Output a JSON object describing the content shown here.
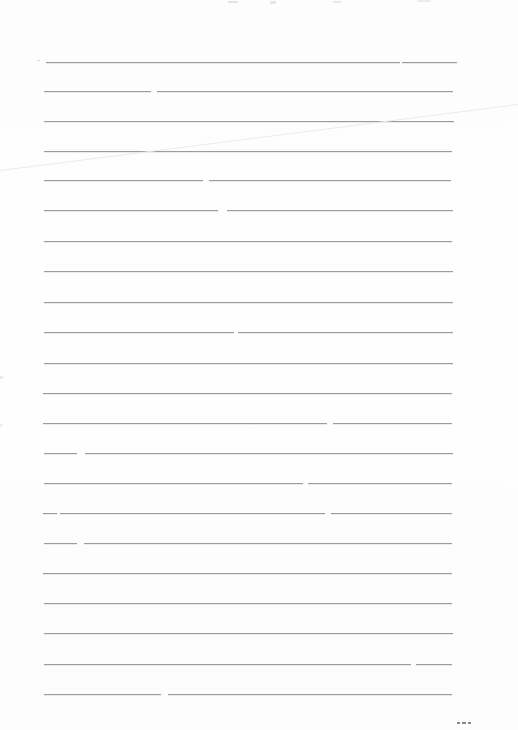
{
  "page": {
    "width_px": 518,
    "height_px": 730,
    "background_color": "#fdfdfd",
    "rule_color": "#9c9c9c",
    "rule_left_x": 44,
    "rule_right_x": 455,
    "rule_spacing_px": 30,
    "rule_count": 22,
    "first_rule_y": 62,
    "last_rule_y": 694
  },
  "ruled_lines": [
    {
      "y": 62,
      "segments": [
        [
          46,
          400
        ],
        [
          402,
          457
        ]
      ]
    },
    {
      "y": 91,
      "segments": [
        [
          44,
          151
        ],
        [
          157,
          453
        ]
      ]
    },
    {
      "y": 121,
      "segments": [
        [
          44,
          454
        ]
      ]
    },
    {
      "y": 151,
      "segments": [
        [
          44,
          452
        ]
      ]
    },
    {
      "y": 180,
      "segments": [
        [
          44,
          203
        ],
        [
          209,
          451
        ]
      ]
    },
    {
      "y": 210,
      "segments": [
        [
          44,
          218
        ],
        [
          227,
          453
        ]
      ]
    },
    {
      "y": 241,
      "segments": [
        [
          44,
          452
        ]
      ]
    },
    {
      "y": 271,
      "segments": [
        [
          44,
          453
        ]
      ]
    },
    {
      "y": 302,
      "segments": [
        [
          44,
          453
        ]
      ]
    },
    {
      "y": 332,
      "segments": [
        [
          44,
          234
        ],
        [
          238,
          453
        ]
      ]
    },
    {
      "y": 363,
      "segments": [
        [
          44,
          453
        ]
      ]
    },
    {
      "y": 393,
      "segments": [
        [
          43,
          452
        ]
      ]
    },
    {
      "y": 423,
      "segments": [
        [
          43,
          327
        ],
        [
          333,
          452
        ]
      ]
    },
    {
      "y": 453,
      "segments": [
        [
          44,
          77
        ],
        [
          85,
          453
        ]
      ]
    },
    {
      "y": 483,
      "segments": [
        [
          44,
          303
        ],
        [
          308,
          452
        ]
      ]
    },
    {
      "y": 513,
      "segments": [
        [
          43,
          57
        ],
        [
          60,
          325
        ],
        [
          331,
          452
        ]
      ]
    },
    {
      "y": 543,
      "segments": [
        [
          44,
          77
        ],
        [
          84,
          452
        ]
      ]
    },
    {
      "y": 573,
      "segments": [
        [
          43,
          452
        ]
      ]
    },
    {
      "y": 603,
      "segments": [
        [
          44,
          452
        ]
      ]
    },
    {
      "y": 633,
      "segments": [
        [
          44,
          453
        ]
      ]
    },
    {
      "y": 664,
      "segments": [
        [
          44,
          411
        ],
        [
          416,
          452
        ]
      ]
    },
    {
      "y": 694,
      "segments": [
        [
          44,
          161
        ],
        [
          168,
          452
        ]
      ]
    }
  ],
  "crease": {
    "x1": 0,
    "y1": 170,
    "x2": 518,
    "y2": 104,
    "color": "#ebebeb"
  },
  "specks": [
    {
      "x": 228,
      "y": 1,
      "w": 10,
      "h": 2,
      "color": "#e3e3e3"
    },
    {
      "x": 270,
      "y": 1,
      "w": 6,
      "h": 3,
      "color": "#e6e6e6"
    },
    {
      "x": 333,
      "y": 1,
      "w": 8,
      "h": 2,
      "color": "#e6e6e6"
    },
    {
      "x": 417,
      "y": 0,
      "w": 14,
      "h": 2,
      "color": "#ebebeb"
    },
    {
      "x": 37,
      "y": 60,
      "w": 3,
      "h": 1,
      "color": "#d9d9d9"
    },
    {
      "x": 0,
      "y": 376,
      "w": 3,
      "h": 3,
      "color": "#e8e8e8"
    },
    {
      "x": 0,
      "y": 424,
      "w": 2,
      "h": 3,
      "color": "#eaeaea"
    }
  ],
  "bottom_right_mark": {
    "y": 722,
    "color": "#8a8a8a",
    "dashes": [
      [
        457,
        460
      ],
      [
        462,
        466
      ],
      [
        468,
        471
      ]
    ]
  }
}
